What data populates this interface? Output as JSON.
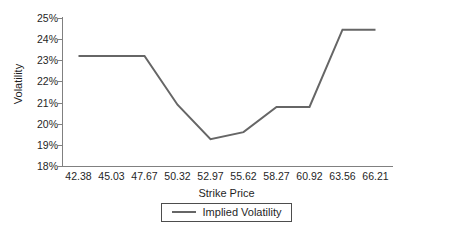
{
  "chart_data": {
    "type": "line",
    "title": "",
    "xlabel": "Strike Price",
    "ylabel": "Volatility",
    "categories": [
      "42.38",
      "45.03",
      "47.67",
      "50.32",
      "52.97",
      "55.62",
      "58.27",
      "60.92",
      "63.56",
      "66.21"
    ],
    "series": [
      {
        "name": "Implied Volatility",
        "values": [
          23.2,
          23.2,
          23.2,
          20.9,
          19.27,
          19.6,
          20.79,
          20.79,
          24.45,
          24.45
        ],
        "color": "#666666"
      }
    ],
    "ylim": [
      18,
      25
    ],
    "ytick_labels": [
      "25%",
      "24%",
      "23%",
      "22%",
      "21%",
      "20%",
      "19%",
      "18%"
    ],
    "ytick_values": [
      25,
      24,
      23,
      22,
      21,
      20,
      19,
      18
    ],
    "yunit": "%",
    "grid": false,
    "legend_position": "bottom"
  },
  "legend": {
    "entries": [
      {
        "label": "Implied Volatility"
      }
    ]
  },
  "axes": {
    "x_title": "Strike Price",
    "y_title": "Volatility"
  },
  "colors": {
    "line": "#666666",
    "axis": "#808080",
    "text": "#1f1f1f",
    "legend_border": "#4d4d4d",
    "background": "#ffffff"
  }
}
